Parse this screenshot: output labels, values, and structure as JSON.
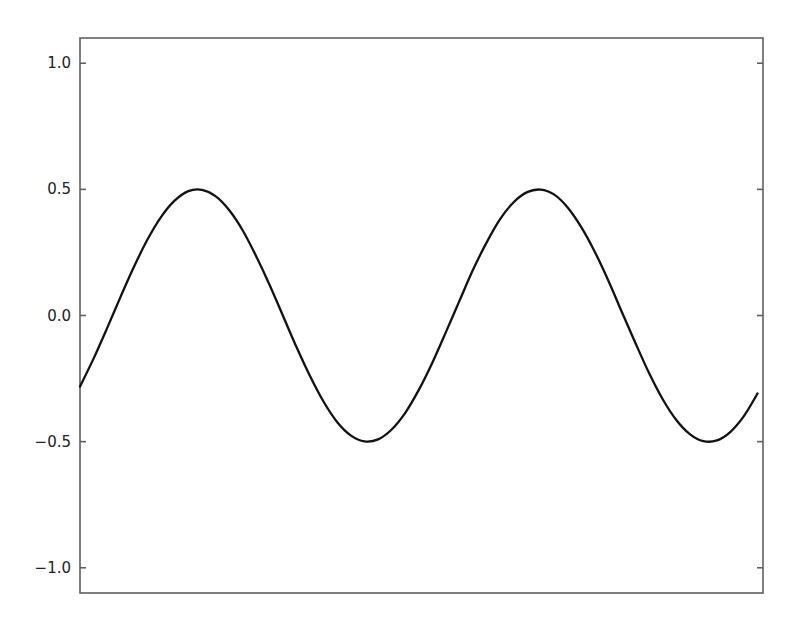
{
  "figure": {
    "background": "#ffffff",
    "frame_color": "#606060",
    "label_color": "#222222"
  },
  "chart_data": {
    "type": "line",
    "title": "",
    "xlabel": "",
    "ylabel": "",
    "function": "y = 0.5*sin(x)",
    "xlim": [
      -0.6,
      12.0
    ],
    "ylim": [
      -1.1,
      1.1
    ],
    "grid": false,
    "legend_position": "none",
    "tick_direction": "in",
    "yticks": [
      {
        "value": 1.0,
        "label": "1.0"
      },
      {
        "value": 0.5,
        "label": "0.5"
      },
      {
        "value": 0.0,
        "label": "0.0"
      },
      {
        "value": -0.5,
        "label": "−0.5"
      },
      {
        "value": -1.0,
        "label": "−1.0"
      }
    ],
    "xticks": [],
    "series": [
      {
        "name": "0.5*sin(x)",
        "color": "#121212",
        "line_width": 2.3,
        "x": [
          -0.6,
          -0.35,
          -0.1,
          0.15,
          0.4,
          0.65,
          0.9,
          1.15,
          1.4,
          1.65,
          1.9,
          2.15,
          2.4,
          2.65,
          2.9,
          3.15,
          3.4,
          3.65,
          3.9,
          4.15,
          4.4,
          4.65,
          4.9,
          5.15,
          5.4,
          5.65,
          5.9,
          6.15,
          6.4,
          6.65,
          6.9,
          7.15,
          7.4,
          7.65,
          7.9,
          8.15,
          8.4,
          8.65,
          8.9,
          9.15,
          9.4,
          9.65,
          9.9,
          10.15,
          10.4,
          10.65,
          10.9,
          11.15,
          11.4,
          11.65,
          11.9
        ],
        "y": [
          -0.282,
          -0.171,
          -0.05,
          0.075,
          0.195,
          0.303,
          0.392,
          0.456,
          0.493,
          0.498,
          0.473,
          0.418,
          0.338,
          0.235,
          0.12,
          -0.004,
          -0.128,
          -0.243,
          -0.344,
          -0.424,
          -0.476,
          -0.499,
          -0.491,
          -0.452,
          -0.386,
          -0.295,
          -0.187,
          -0.066,
          0.058,
          0.181,
          0.289,
          0.382,
          0.449,
          0.489,
          0.499,
          0.479,
          0.427,
          0.349,
          0.251,
          0.137,
          0.012,
          -0.111,
          -0.229,
          -0.332,
          -0.414,
          -0.47,
          -0.498,
          -0.495,
          -0.461,
          -0.398,
          -0.309
        ]
      }
    ]
  }
}
